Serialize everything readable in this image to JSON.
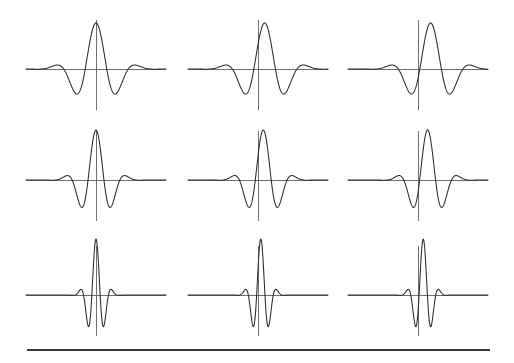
{
  "figure": {
    "title": "",
    "background_color": "#ffffff",
    "width": 514,
    "height": 363,
    "curve_color": "#2b2b2b",
    "axis_color": "#6f6f6f",
    "rule_color": "#3a3a3a"
  },
  "bottom_rule": {
    "name": "horizontal-rule",
    "x1": 27,
    "x2": 490,
    "y": 350,
    "thickness": 2.2
  },
  "chart_data": {
    "type": "line",
    "title": "",
    "subtitle": "",
    "xlabel": "",
    "ylabel": "",
    "grid": false,
    "legend": null,
    "layout": {
      "rows": 3,
      "cols": 3,
      "panel_axis_x": [
        96,
        258,
        418
      ],
      "panel_baseline_y": [
        69,
        180,
        295
      ],
      "panel_half_width": 70,
      "vertical_axis_top_offset": -49,
      "vertical_axis_bottom_offset": 41,
      "x_domain": [
        -4.0,
        4.0
      ],
      "y_domain": [
        -1.0,
        1.0
      ],
      "samples": 401
    },
    "panels": [
      {
        "row": 0,
        "col": 0,
        "name": "wavelet-r1c1",
        "sigma": 1.05,
        "omega": 2.55,
        "shift": 0.0,
        "amplitude": 0.88,
        "axis_x": 96,
        "baseline_y": 69,
        "peak_height_px": 46,
        "lobe_depth_px": 15
      },
      {
        "row": 0,
        "col": 1,
        "name": "wavelet-r1c2",
        "sigma": 1.05,
        "omega": 2.55,
        "shift": 0.38,
        "amplitude": 0.88,
        "axis_x": 258,
        "baseline_y": 69,
        "peak_height_px": 46,
        "lobe_depth_px": 15
      },
      {
        "row": 0,
        "col": 2,
        "name": "wavelet-r1c3",
        "sigma": 1.05,
        "omega": 2.55,
        "shift": 0.72,
        "amplitude": 0.88,
        "axis_x": 418,
        "baseline_y": 69,
        "peak_height_px": 46,
        "lobe_depth_px": 15
      },
      {
        "row": 1,
        "col": 0,
        "name": "wavelet-r2c1",
        "sigma": 0.78,
        "omega": 3.45,
        "shift": 0.0,
        "amplitude": 0.93,
        "axis_x": 96,
        "baseline_y": 180,
        "peak_height_px": 50,
        "lobe_depth_px": 17
      },
      {
        "row": 1,
        "col": 1,
        "name": "wavelet-r2c2",
        "sigma": 0.78,
        "omega": 3.45,
        "shift": 0.3,
        "amplitude": 0.93,
        "axis_x": 258,
        "baseline_y": 180,
        "peak_height_px": 50,
        "lobe_depth_px": 17
      },
      {
        "row": 1,
        "col": 2,
        "name": "wavelet-r2c3",
        "sigma": 0.78,
        "omega": 3.45,
        "shift": 0.55,
        "amplitude": 0.93,
        "axis_x": 418,
        "baseline_y": 180,
        "peak_height_px": 50,
        "lobe_depth_px": 17
      },
      {
        "row": 2,
        "col": 0,
        "name": "wavelet-r3c1",
        "sigma": 0.42,
        "omega": 6.6,
        "shift": 0.0,
        "amplitude": 1.0,
        "axis_x": 96,
        "baseline_y": 295,
        "peak_height_px": 56,
        "lobe_depth_px": 20
      },
      {
        "row": 2,
        "col": 1,
        "name": "wavelet-r3c2",
        "sigma": 0.42,
        "omega": 6.6,
        "shift": 0.16,
        "amplitude": 1.0,
        "axis_x": 258,
        "baseline_y": 295,
        "peak_height_px": 56,
        "lobe_depth_px": 20
      },
      {
        "row": 2,
        "col": 2,
        "name": "wavelet-r3c3",
        "sigma": 0.42,
        "omega": 6.6,
        "shift": 0.3,
        "amplitude": 1.0,
        "axis_x": 418,
        "baseline_y": 295,
        "peak_height_px": 56,
        "lobe_depth_px": 20
      }
    ]
  }
}
